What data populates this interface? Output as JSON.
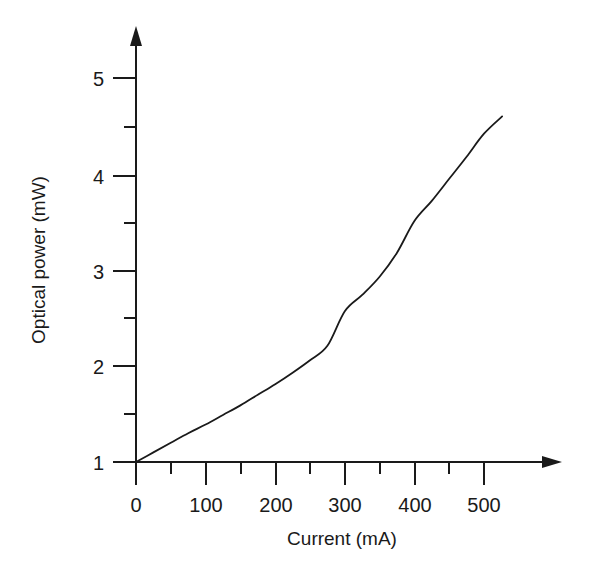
{
  "chart_data": {
    "type": "line",
    "title": "",
    "xlabel": "Current (mA)",
    "ylabel": "Optical power (mW)",
    "xlim": [
      0,
      560
    ],
    "ylim": [
      1,
      5.4
    ],
    "grid": false,
    "legend": null,
    "x_ticks": [
      0,
      100,
      200,
      300,
      400,
      500
    ],
    "x_tick_labels": [
      "0",
      "100",
      "200",
      "300",
      "400",
      "500"
    ],
    "x_minor_ticks": [
      50,
      150,
      250,
      350,
      450
    ],
    "y_ticks": [
      1,
      2,
      3,
      4,
      5
    ],
    "y_tick_labels": [
      "1",
      "2",
      "3",
      "4",
      "5"
    ],
    "y_minor_ticks": [
      1.5,
      2.5,
      3.5,
      4.5
    ],
    "series": [
      {
        "name": "L-I curve",
        "color": "#1a1a1a",
        "x": [
          0,
          25,
          50,
          75,
          100,
          125,
          150,
          175,
          200,
          225,
          250,
          275,
          300,
          325,
          350,
          375,
          400,
          425,
          450,
          475,
          500,
          526
        ],
        "y": [
          1.0,
          1.1,
          1.2,
          1.3,
          1.39,
          1.49,
          1.59,
          1.7,
          1.81,
          1.93,
          2.06,
          2.21,
          2.57,
          2.74,
          2.93,
          3.18,
          3.51,
          3.72,
          3.95,
          4.18,
          4.42,
          4.6
        ]
      }
    ]
  },
  "axes": {
    "x_axis_name": "current-axis",
    "y_axis_name": "optical-power-axis",
    "arrow_heads": true
  }
}
